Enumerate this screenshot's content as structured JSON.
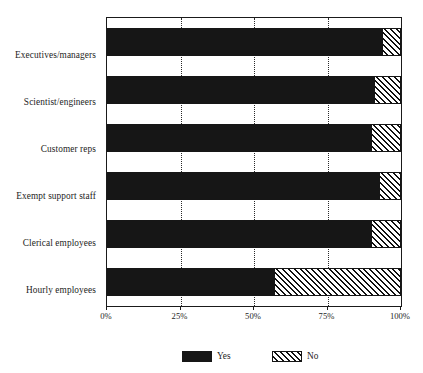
{
  "chart_data": {
    "type": "bar",
    "orientation": "horizontal",
    "stacked": true,
    "percent": true,
    "title": "",
    "subtitle": "",
    "xlabel": "",
    "ylabel": "",
    "xlim": [
      0,
      100
    ],
    "xticks": [
      0,
      25,
      50,
      75,
      100
    ],
    "xtick_labels": [
      "0%",
      "25%",
      "50%",
      "75%",
      "100%"
    ],
    "grid": true,
    "grid_axis": "x",
    "grid_style": "dotted",
    "legend_position": "bottom",
    "categories": [
      "Executives/managers",
      "Scientist/engineers",
      "Customer reps",
      "Exempt support staff",
      "Clerical employees",
      "Hourly employees"
    ],
    "series": [
      {
        "name": "Yes",
        "color": "#161616",
        "fill": "solid",
        "values": [
          94,
          91,
          90,
          93,
          90,
          57
        ]
      },
      {
        "name": "No",
        "color": "#111111",
        "fill": "diagonal-hatch",
        "values": [
          6,
          9,
          10,
          7,
          10,
          43
        ]
      }
    ]
  },
  "legend": {
    "items": [
      {
        "label": "Yes",
        "swatch": "solid-black-swatch"
      },
      {
        "label": "No",
        "swatch": "hatched-swatch"
      }
    ]
  }
}
